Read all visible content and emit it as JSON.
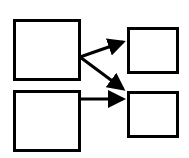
{
  "diagram": {
    "background": "#ffffff",
    "stroke_color": "#000000",
    "nodes": [
      {
        "id": "left-top",
        "x": 13,
        "y": 19,
        "w": 67,
        "h": 62
      },
      {
        "id": "left-bottom",
        "x": 13,
        "y": 90,
        "w": 67,
        "h": 62
      },
      {
        "id": "right-top",
        "x": 127,
        "y": 27,
        "w": 51,
        "h": 46
      },
      {
        "id": "right-bottom",
        "x": 127,
        "y": 91,
        "w": 51,
        "h": 47
      }
    ],
    "edges": [
      {
        "from": "left-top",
        "to": "right-top"
      },
      {
        "from": "left-top",
        "to": "right-bottom"
      },
      {
        "from": "left-bottom",
        "to": "right-bottom"
      }
    ]
  }
}
